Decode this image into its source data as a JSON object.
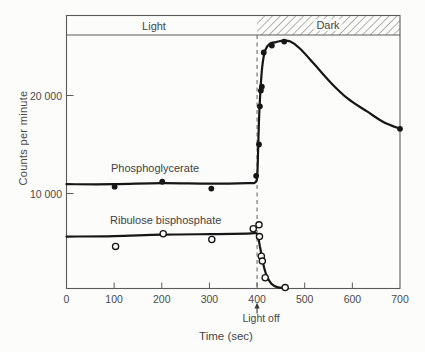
{
  "chart_data": {
    "type": "line",
    "title": "",
    "xlabel": "Time (sec)",
    "ylabel": "Counts per minute",
    "xlim": [
      0,
      700
    ],
    "ylim": [
      0,
      26000
    ],
    "grid": false,
    "legend_position": "inline-labels",
    "x_ticks": {
      "values": [
        0,
        100,
        200,
        300,
        400,
        500,
        600,
        700
      ],
      "labels": [
        "0",
        "100",
        "200",
        "300",
        "400",
        "500",
        "600",
        "700"
      ]
    },
    "y_ticks": [
      {
        "value": 20000,
        "label": "20 000"
      },
      {
        "value": 10000,
        "label": "10 000"
      }
    ],
    "annotations": {
      "light_band_label": "Light",
      "light_band_range_sec": [
        0,
        400
      ],
      "dark_band_label": "Dark",
      "dark_band_range_sec": [
        400,
        700
      ],
      "dark_band_style": "diagonal-hatch",
      "light_off_label": "Light off",
      "light_off_x": 400
    },
    "series": [
      {
        "name": "Phosphoglycerate",
        "marker": "filled-circle",
        "color": "#161616",
        "points": [
          [
            101,
            10700
          ],
          [
            201,
            11200
          ],
          [
            304,
            10500
          ],
          [
            398,
            11800
          ],
          [
            404,
            15000
          ],
          [
            406,
            18900
          ],
          [
            408,
            20500
          ],
          [
            410,
            20900
          ],
          [
            414,
            24400
          ],
          [
            431,
            25100
          ],
          [
            457,
            25500
          ],
          [
            700,
            16600
          ]
        ],
        "curve": [
          [
            0,
            10950
          ],
          [
            100,
            10950
          ],
          [
            200,
            11050
          ],
          [
            300,
            11000
          ],
          [
            380,
            11050
          ],
          [
            395,
            11100
          ],
          [
            400,
            11600
          ],
          [
            402,
            14000
          ],
          [
            404,
            17500
          ],
          [
            407,
            20500
          ],
          [
            411,
            23000
          ],
          [
            417,
            24600
          ],
          [
            427,
            25300
          ],
          [
            440,
            25450
          ],
          [
            455,
            25600
          ],
          [
            470,
            25500
          ],
          [
            490,
            24800
          ],
          [
            520,
            23200
          ],
          [
            555,
            21300
          ],
          [
            590,
            19700
          ],
          [
            630,
            18400
          ],
          [
            665,
            17300
          ],
          [
            700,
            16600
          ]
        ]
      },
      {
        "name": "Ribulose bisphosphate",
        "marker": "open-circle",
        "color": "#161616",
        "points": [
          [
            103,
            4600
          ],
          [
            203,
            5900
          ],
          [
            305,
            5300
          ],
          [
            392,
            6400
          ],
          [
            404,
            6800
          ],
          [
            405,
            5600
          ],
          [
            409,
            3600
          ],
          [
            411,
            3100
          ],
          [
            417,
            1400
          ],
          [
            459,
            400
          ]
        ],
        "curve": [
          [
            0,
            5600
          ],
          [
            100,
            5650
          ],
          [
            200,
            5800
          ],
          [
            300,
            5850
          ],
          [
            380,
            5900
          ],
          [
            398,
            5950
          ],
          [
            402,
            5600
          ],
          [
            406,
            4600
          ],
          [
            410,
            3600
          ],
          [
            415,
            2400
          ],
          [
            421,
            1500
          ],
          [
            430,
            800
          ],
          [
            442,
            450
          ],
          [
            458,
            350
          ],
          [
            465,
            330
          ]
        ]
      }
    ]
  }
}
